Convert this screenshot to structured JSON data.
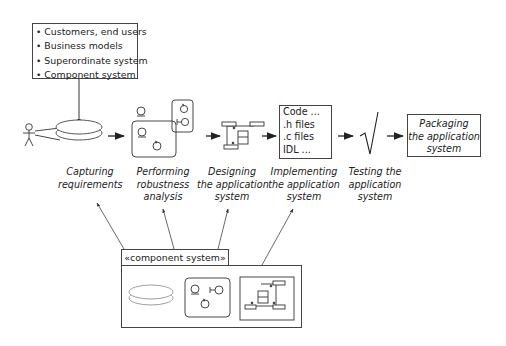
{
  "inputs": {
    "items": [
      "Customers, end users",
      "Business models",
      "Superordinate system",
      "Component system"
    ]
  },
  "steps": [
    {
      "id": "capture",
      "label_lines": [
        "Capturing",
        "requirements"
      ]
    },
    {
      "id": "robustness",
      "label_lines": [
        "Performing",
        "robustness",
        "analysis"
      ]
    },
    {
      "id": "design",
      "label_lines": [
        "Designing",
        "the application",
        "system"
      ]
    },
    {
      "id": "implement",
      "label_lines": [
        "Implementing",
        "the application",
        "system"
      ]
    },
    {
      "id": "test",
      "label_lines": [
        "Testing the",
        "application",
        "system"
      ]
    },
    {
      "id": "package",
      "label_lines": [
        "Packaging",
        "the application",
        "system"
      ]
    }
  ],
  "code_box": {
    "lines": [
      "Code ...",
      ".h files",
      ".c files",
      "IDL ..."
    ]
  },
  "component_package": {
    "stereotype": "«component system»"
  },
  "test_icon": "√"
}
